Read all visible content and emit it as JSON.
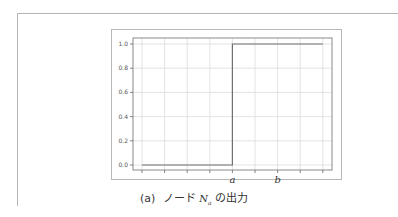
{
  "caption": {
    "prefix": "(a)",
    "text_before": "ノード",
    "math_var": "N",
    "math_sub": "a",
    "text_after": "の出力"
  },
  "chart_data": {
    "type": "line",
    "title": "",
    "xlabel": "",
    "ylabel": "",
    "x_tick_labels": [
      {
        "label": "a",
        "position": 4
      },
      {
        "label": "b",
        "position": 6
      }
    ],
    "x_tick_count": 9,
    "y_ticks": [
      0.0,
      0.2,
      0.4,
      0.6,
      0.8,
      1.0
    ],
    "y_tick_labels": [
      "0.0",
      "0.2",
      "0.4",
      "0.6",
      "0.8",
      "1.0"
    ],
    "ylim": [
      0.0,
      1.0
    ],
    "grid": true,
    "legend": null,
    "series": [
      {
        "name": "node_Na_output",
        "step": true,
        "x": [
          0,
          4,
          4,
          8
        ],
        "y": [
          0.0,
          0.0,
          1.0,
          1.0
        ],
        "color": "#707070"
      }
    ]
  },
  "colors": {
    "line": "#707070",
    "grid": "#dcdcdc",
    "axes": "#8a8a8a",
    "frame": "#b5b5b5"
  }
}
